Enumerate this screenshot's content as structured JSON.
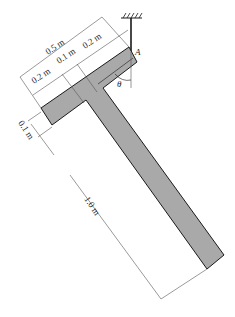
{
  "diagram": {
    "type": "mechanics-free-body",
    "body": "T-shaped bar suspended from a pin at A",
    "colors": {
      "body_fill": "#a9a9a9",
      "outline": "#1a1a1a",
      "dim_line": "#555555",
      "background": "#ffffff"
    },
    "labels": {
      "total_width": "0.5 m",
      "left_segment": "0.2 m",
      "middle_segment": "0.1 m",
      "right_segment": "0.2 m",
      "crossbar_thickness": "0.1 m",
      "stem_length": "1.0 m",
      "point": "A",
      "angle": "θ"
    }
  }
}
